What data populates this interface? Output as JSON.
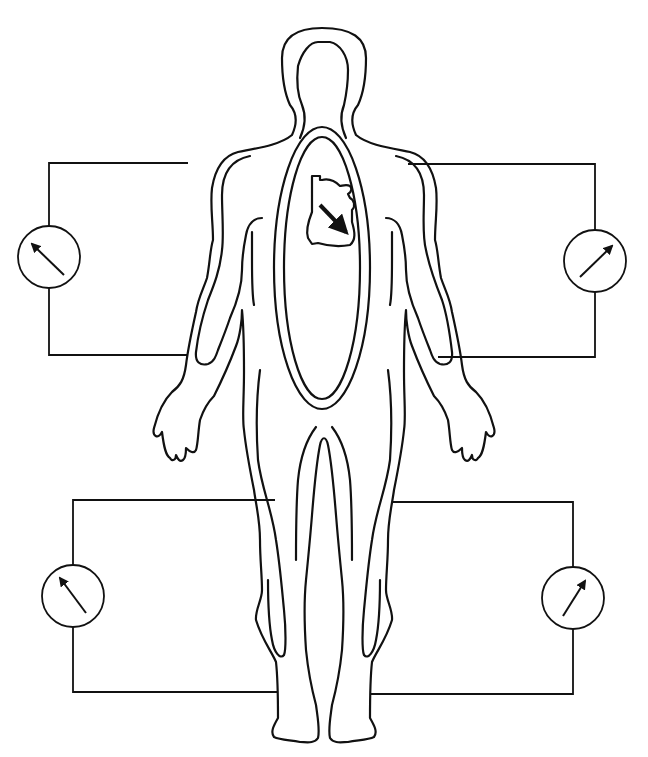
{
  "diagram": {
    "colors": {
      "line": "#111111",
      "background": "#ffffff"
    },
    "figure": {
      "name": "human-body-outline",
      "thorax_ellipse": {
        "cx": 322,
        "cy": 268,
        "rx_outer": 48,
        "ry_outer": 141,
        "rx_inner": 38,
        "ry_inner": 131
      },
      "heart": {
        "icon": "heart-icon",
        "dipole_arrow": "down-right"
      }
    },
    "circuits": [
      {
        "id": "upper-left",
        "limb": "right-arm",
        "rect": [
          49,
          163,
          188,
          355
        ],
        "meter": {
          "cx": 49,
          "cy": 257,
          "r": 31,
          "needle_direction": "up-left"
        }
      },
      {
        "id": "upper-right",
        "limb": "left-arm",
        "rect": [
          408,
          164,
          595,
          357
        ],
        "meter": {
          "cx": 595,
          "cy": 261,
          "r": 31,
          "needle_direction": "up-right"
        }
      },
      {
        "id": "lower-left",
        "limb": "right-leg",
        "rect": [
          73,
          500,
          275,
          692
        ],
        "meter": {
          "cx": 73,
          "cy": 596,
          "r": 31,
          "needle_direction": "up-left"
        }
      },
      {
        "id": "lower-right",
        "limb": "left-leg",
        "rect": [
          393,
          502,
          573,
          694
        ],
        "meter": {
          "cx": 573,
          "cy": 598,
          "r": 31,
          "needle_direction": "up-right"
        }
      }
    ]
  }
}
